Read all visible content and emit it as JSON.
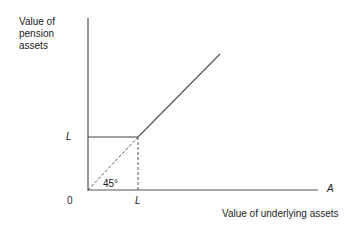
{
  "diagram": {
    "y_axis_label": [
      "Value of",
      "pension",
      "assets"
    ],
    "x_axis_label": "Value of underlying assets",
    "origin_label": "0",
    "y_tick_label": "L",
    "x_tick_label": "L",
    "x_axis_end_label": "A",
    "angle_label": "45°"
  }
}
